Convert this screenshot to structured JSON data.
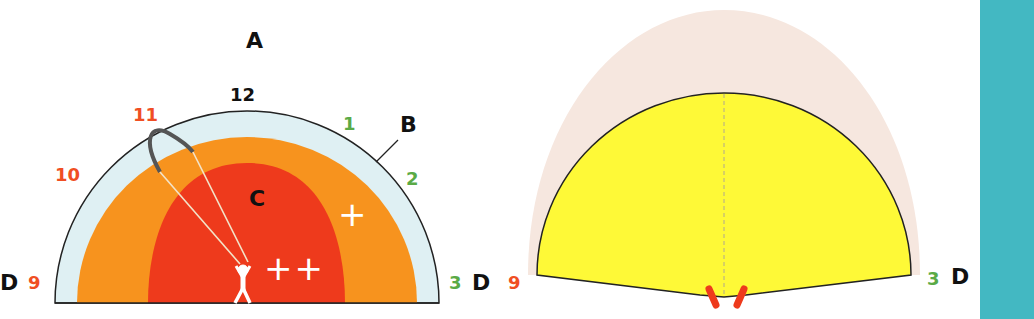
{
  "left_diagram": {
    "title_label": "A",
    "zone_labels": {
      "edge": "B",
      "power": "C",
      "sides": "D"
    },
    "clock_positions": {
      "p12": "12",
      "p11": "11",
      "p10": "10",
      "p9": "9",
      "p1": "1",
      "p2": "2",
      "p3": "3"
    },
    "power_marks": {
      "moderate": "+",
      "strong": "++"
    }
  },
  "right_diagram": {
    "left_position": "9",
    "right_position": "3",
    "side_label": "D"
  },
  "colors": {
    "edge_zone": "#dff0f3",
    "outer_power": "#f7931e",
    "inner_power": "#ee3a1c",
    "red_label": "#f04e23",
    "green_label": "#5aaa46",
    "yellow_window": "#fef937",
    "faded_window": "#f6e7df",
    "teal_bar": "#43b8c2"
  }
}
